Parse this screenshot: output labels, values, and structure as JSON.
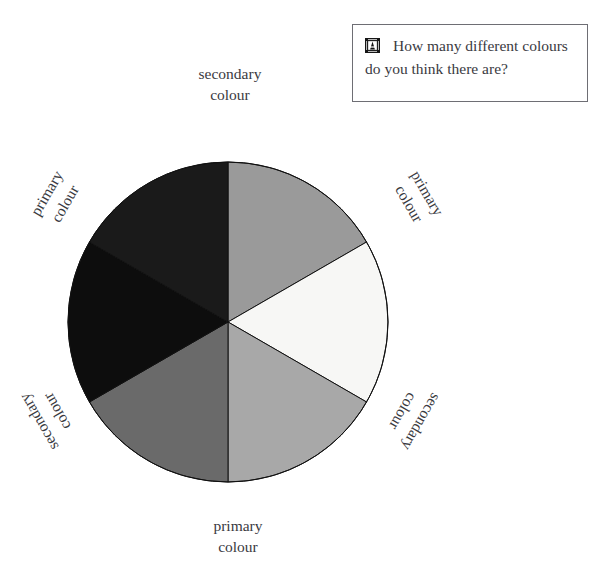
{
  "page": {
    "width": 598,
    "height": 579,
    "background": "#ffffff",
    "top_cropped_line": "· · ·      ·        ·      ·"
  },
  "question_box": {
    "icon": "framed-ornament-icon",
    "text": "How many different colours do you think there are?",
    "border_color": "#6e6e74",
    "text_color": "#3a3a3f"
  },
  "chart_data": {
    "type": "pie",
    "subtitle": "",
    "xlabel": "",
    "ylabel": "",
    "legend_position": "around-slices",
    "grid": false,
    "center": {
      "x": 228,
      "y": 322
    },
    "radius": 160,
    "slice_count": 6,
    "slice_angle_degrees": 60,
    "stroke_color": "#111111",
    "stroke_width": 1,
    "categories": [
      "secondary colour",
      "primary colour",
      "secondary colour",
      "primary colour",
      "secondary colour",
      "primary colour"
    ],
    "values": [
      60,
      60,
      60,
      60,
      60,
      60
    ],
    "slices": [
      {
        "position": "top",
        "kind": "secondary",
        "label_line1": "secondary",
        "label_line2": "colour",
        "color": "#9a9a9a",
        "start_angle": -90,
        "end_angle": -30,
        "label_rotation": 0
      },
      {
        "position": "upper-right",
        "kind": "primary",
        "label_line1": "primary",
        "label_line2": "colour",
        "color": "#f7f7f5",
        "start_angle": -30,
        "end_angle": 30,
        "label_rotation": 60
      },
      {
        "position": "lower-right",
        "kind": "secondary",
        "label_line1": "secondary",
        "label_line2": "colour",
        "color": "#a8a8a8",
        "start_angle": 30,
        "end_angle": 90,
        "label_rotation": 120
      },
      {
        "position": "bottom",
        "kind": "primary",
        "label_line1": "primary",
        "label_line2": "colour",
        "color": "#6a6a6a",
        "start_angle": 90,
        "end_angle": 150,
        "label_rotation": 0
      },
      {
        "position": "lower-left",
        "kind": "secondary",
        "label_line1": "secondary",
        "label_line2": "colour",
        "color": "#0d0d0d",
        "start_angle": 150,
        "end_angle": 210,
        "label_rotation": -120
      },
      {
        "position": "upper-left",
        "kind": "primary",
        "label_line1": "primary",
        "label_line2": "colour",
        "color": "#1a1a1a",
        "start_angle": 210,
        "end_angle": 270,
        "label_rotation": -60
      }
    ]
  }
}
